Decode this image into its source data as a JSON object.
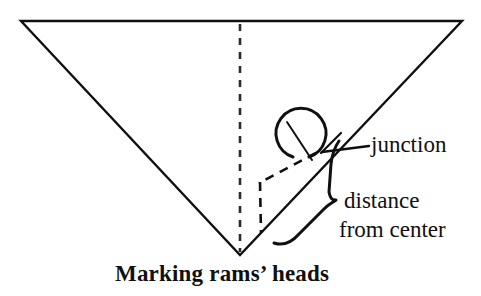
{
  "figure": {
    "caption": "Marking rams’ heads",
    "background_color": "#ffffff",
    "ink_color": "#101010",
    "annotations": {
      "junction_label": "junction",
      "distance_label_line1": "distance",
      "distance_label_line2": "from center"
    },
    "geometry": {
      "triangle": {
        "description": "inverted-triangle",
        "top_left": [
          21,
          21
        ],
        "top_right": [
          462,
          21
        ],
        "apex": [
          240,
          255
        ]
      },
      "center_line": {
        "description": "dashed-vertical-center-line",
        "from": [
          240,
          24
        ],
        "to": [
          240,
          252
        ],
        "style": "dashed"
      },
      "offset_outline": {
        "description": "dashed-offset-parallelogram",
        "points": [
          [
            316,
            154
          ],
          [
            260,
            183
          ],
          [
            261,
            233
          ]
        ],
        "style": "dashed"
      },
      "ram_head_spiral": {
        "description": "open-circle-rams-horn",
        "center": [
          305,
          133
        ],
        "radius": 24
      },
      "junction_leader": {
        "from": [
          369,
          146
        ],
        "to": [
          323,
          152
        ]
      },
      "brace": {
        "description": "rotated-curly-brace",
        "tip": [
          336,
          199
        ]
      }
    }
  }
}
